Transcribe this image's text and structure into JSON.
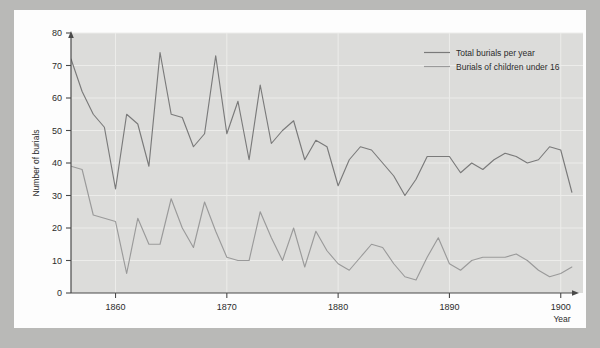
{
  "figure": {
    "background_color": "#b9b9b7",
    "paper_color": "#fdfdfd",
    "plot_background_color": "#dcdcda",
    "line_color": "#7a7a7a",
    "axis_color": "#4a4a4a"
  },
  "chart_data": {
    "type": "line",
    "title": "",
    "xlabel": "Year",
    "ylabel": "Number of burials",
    "xlim": [
      1856,
      1902
    ],
    "ylim": [
      0,
      80
    ],
    "xticks": [
      1860,
      1870,
      1880,
      1890,
      1900
    ],
    "yticks": [
      0,
      10,
      20,
      30,
      40,
      50,
      60,
      70,
      80
    ],
    "grid": true,
    "legend_position": "top-right",
    "x": [
      1856,
      1857,
      1858,
      1859,
      1860,
      1861,
      1862,
      1863,
      1864,
      1865,
      1866,
      1867,
      1868,
      1869,
      1870,
      1871,
      1872,
      1873,
      1874,
      1875,
      1876,
      1877,
      1878,
      1879,
      1880,
      1881,
      1882,
      1883,
      1884,
      1885,
      1886,
      1887,
      1888,
      1889,
      1890,
      1891,
      1892,
      1893,
      1894,
      1895,
      1896,
      1897,
      1898,
      1899,
      1900,
      1901
    ],
    "series": [
      {
        "name": "Total burials per year",
        "values": [
          72,
          62,
          55,
          51,
          32,
          55,
          52,
          39,
          74,
          55,
          54,
          45,
          49,
          73,
          49,
          59,
          41,
          64,
          46,
          50,
          53,
          41,
          47,
          45,
          33,
          41,
          45,
          44,
          40,
          36,
          30,
          35,
          42,
          42,
          42,
          37,
          40,
          38,
          41,
          43,
          42,
          40,
          41,
          45,
          44,
          31
        ]
      },
      {
        "name": "Burials of children under 16",
        "values": [
          39,
          38,
          24,
          23,
          22,
          6,
          23,
          15,
          15,
          29,
          20,
          14,
          28,
          19,
          11,
          10,
          10,
          25,
          17,
          10,
          20,
          8,
          19,
          13,
          9,
          7,
          11,
          15,
          14,
          9,
          5,
          4,
          11,
          17,
          9,
          7,
          10,
          11,
          11,
          11,
          12,
          10,
          7,
          5,
          6,
          8
        ]
      }
    ]
  },
  "legend": {
    "items": [
      {
        "label": "Total burials per year"
      },
      {
        "label": "Burials of children under 16"
      }
    ]
  },
  "axes": {
    "y_label": "Number of burials",
    "x_label": "Year",
    "x_tick_labels": [
      "1860",
      "1870",
      "1880",
      "1890",
      "1900"
    ],
    "y_tick_labels": [
      "0",
      "10",
      "20",
      "30",
      "40",
      "50",
      "60",
      "70",
      "80"
    ]
  }
}
